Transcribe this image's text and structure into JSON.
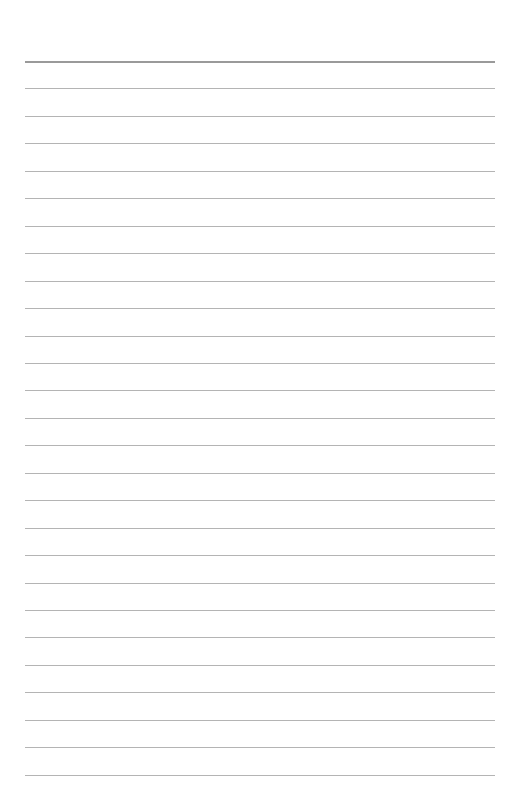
{
  "page": {
    "type": "lined-paper",
    "background_color": "#ffffff",
    "rule_color": "#b4b4b4",
    "header_rule_color": "#9a9a9a",
    "rule_left": 25,
    "rule_width": 470,
    "first_rule_y": 61,
    "rule_spacing": 27.45,
    "rule_count": 27
  }
}
